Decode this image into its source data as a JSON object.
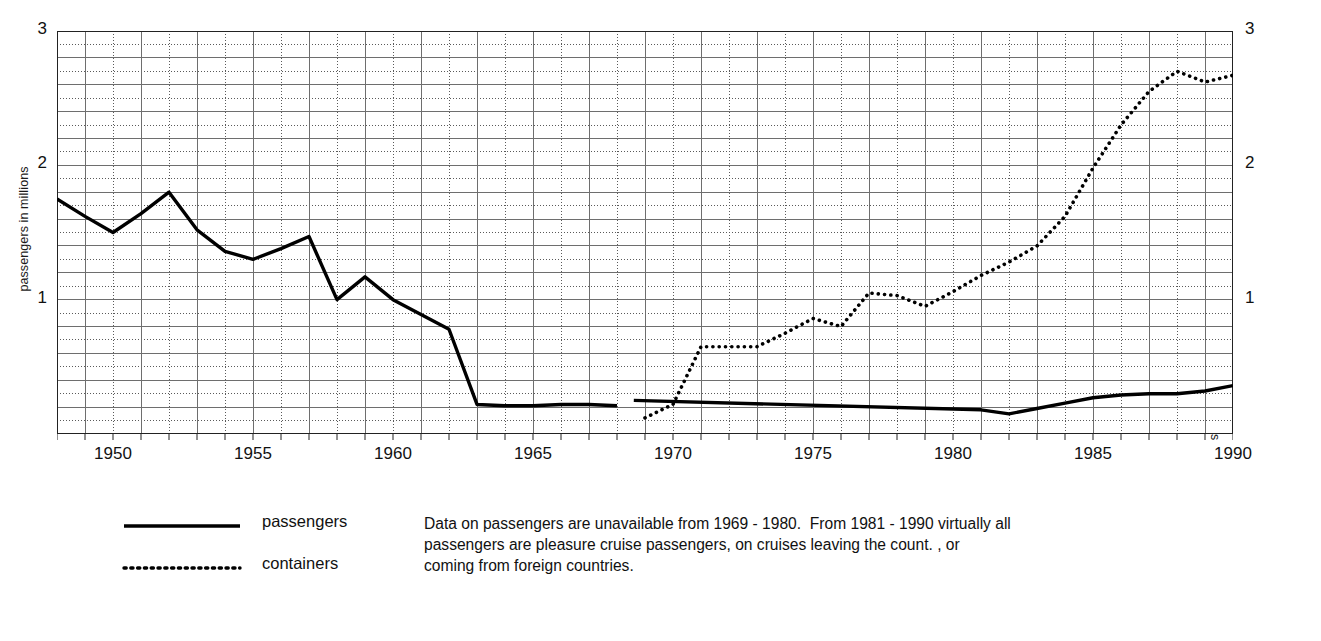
{
  "chart_data": {
    "type": "line",
    "title": "",
    "xlabel": "",
    "ylabel": "passengers in millions",
    "ylabel_right": "containers in millions of metric tonnes",
    "xlim": [
      1948,
      1990
    ],
    "ylim": [
      0,
      3
    ],
    "y_ticks": [
      "1",
      "2",
      "3"
    ],
    "y_tick_values": [
      1,
      2,
      3
    ],
    "y_ticks_right": [
      "1",
      "2",
      "3"
    ],
    "x_ticks": [
      "1950",
      "1955",
      "1960",
      "1965",
      "1970",
      "1975",
      "1980",
      "1985",
      "1990"
    ],
    "x_tick_values": [
      1950,
      1955,
      1960,
      1965,
      1970,
      1975,
      1980,
      1985,
      1990
    ],
    "grid": "major solid every 0.2 and every odd year; minor dotted every 0.1 and every even year",
    "legend_position": "below-left",
    "series": [
      {
        "name": "passengers",
        "axis": "left",
        "style": "solid",
        "color": "#000000",
        "segments": [
          {
            "x": [
              1948,
              1949,
              1950,
              1951,
              1952,
              1953,
              1954,
              1955,
              1956,
              1957,
              1958,
              1959,
              1960,
              1961,
              1962,
              1963,
              1964,
              1965,
              1966,
              1967,
              1968
            ],
            "y": [
              1.75,
              1.62,
              1.5,
              1.64,
              1.8,
              1.52,
              1.36,
              1.3,
              1.38,
              1.47,
              1.0,
              1.17,
              1.0,
              0.89,
              0.78,
              0.22,
              0.21,
              0.21,
              0.22,
              0.22,
              0.21
            ]
          },
          {
            "x": [
              1968.6,
              1981,
              1982,
              1983,
              1984,
              1985,
              1986,
              1987,
              1988,
              1989,
              1990
            ],
            "y": [
              0.25,
              0.18,
              0.15,
              0.19,
              0.23,
              0.27,
              0.29,
              0.3,
              0.3,
              0.32,
              0.36
            ]
          }
        ]
      },
      {
        "name": "containers",
        "axis": "right",
        "style": "dotted",
        "color": "#000000",
        "segments": [
          {
            "x": [
              1969,
              1970,
              1971,
              1972,
              1973,
              1974,
              1975,
              1976,
              1977,
              1978,
              1979,
              1980,
              1981,
              1982,
              1983,
              1984,
              1985,
              1986,
              1987,
              1988,
              1989,
              1990
            ],
            "y": [
              0.12,
              0.22,
              0.65,
              0.65,
              0.65,
              0.75,
              0.86,
              0.8,
              1.05,
              1.03,
              0.95,
              1.06,
              1.18,
              1.28,
              1.4,
              1.62,
              1.98,
              2.3,
              2.55,
              2.7,
              2.62,
              2.67
            ]
          }
        ]
      }
    ],
    "annotations": [
      "Data on passengers are unavailable from 1969 - 1980.  From 1981 - 1990 virtually all",
      "passengers are pleasure cruise passengers, on cruises leaving the count. , or",
      "coming from foreign countries."
    ]
  },
  "legend": {
    "passengers_label": "passengers",
    "containers_label": "containers"
  },
  "caption": {
    "line1": "Data on passengers are unavailable from 1969 - 1980.  From 1981 - 1990 virtually all",
    "line2": "passengers are pleasure cruise passengers, on cruises leaving the count. , or",
    "line3": "coming from foreign countries."
  }
}
